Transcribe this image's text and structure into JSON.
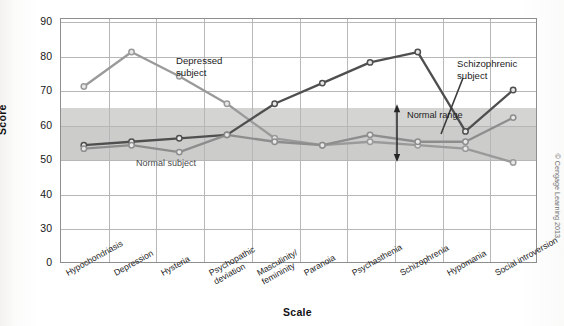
{
  "figure": {
    "credit": "© Cengage Learning 2013",
    "y_axis_title": "Score",
    "x_axis_title": "Scale"
  },
  "annotations": {
    "depressed": {
      "line1": "Depressed",
      "line2": "subject"
    },
    "schizophrenic": {
      "line1": "Schizophrenic",
      "line2": "subject"
    },
    "normal_subject": "Normal subject",
    "normal_range": "Normal range"
  },
  "colors": {
    "depressed_line": "#9a9a9a",
    "schizophrenic_line": "#4f4f4f",
    "normal_line": "#8d8d8d",
    "band": "#c9c9c7",
    "band_upper": "#d2d2d0",
    "grid": "#b7b7b7",
    "axis": "#8e8e8e",
    "marker_fill": "#e8e8e8"
  },
  "chart_data": {
    "type": "line",
    "title": "",
    "xlabel": "Scale",
    "ylabel": "Score",
    "ylim": [
      0,
      90
    ],
    "yticks": [
      0,
      30,
      40,
      50,
      60,
      70,
      80,
      90
    ],
    "axis_break_between": [
      0,
      30
    ],
    "grid": true,
    "legend": "inline-annotations",
    "categories": [
      "Hypochondriasis",
      "Depression",
      "Hysteria",
      "Psychopathic deviation",
      "Masculinity/femininity",
      "Paranoia",
      "Psychasthenia",
      "Schizophrenia",
      "Hypomania",
      "Social introversion"
    ],
    "series": [
      {
        "name": "Depressed subject",
        "values": [
          71,
          81,
          74,
          66,
          56,
          54,
          55,
          54,
          53,
          49
        ]
      },
      {
        "name": "Schizophrenic subject",
        "values": [
          54,
          55,
          56,
          57,
          66,
          72,
          78,
          81,
          58,
          70
        ]
      },
      {
        "name": "Normal subject",
        "values": [
          53,
          54,
          52,
          57,
          55,
          54,
          57,
          55,
          55,
          62
        ]
      }
    ],
    "shaded_region": {
      "label": "Normal range",
      "ymin": 50,
      "ymax": 65
    }
  }
}
